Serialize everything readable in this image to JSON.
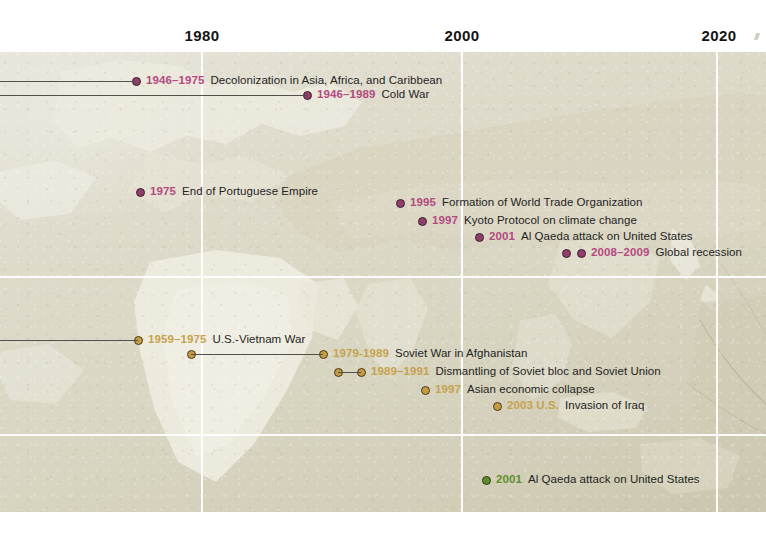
{
  "axis": {
    "ticks": [
      {
        "label": "1980",
        "x": 202
      },
      {
        "label": "2000",
        "x": 462
      },
      {
        "label": "2020",
        "x": 719
      }
    ]
  },
  "grid": {
    "vertical_x": [
      202,
      462,
      717
    ],
    "horizontal_y": [
      276,
      434
    ]
  },
  "colors": {
    "purple_dot": "#8f3f68",
    "purple_text": "#b34a80",
    "orange_dot": "#c79a46",
    "orange_text": "#c5a24e",
    "green_dot": "#5f8a2e",
    "green_text": "#5f8f2c",
    "description_text": "#24241f",
    "gridline": "#ffffff",
    "span_line": "#51504a",
    "map_land": "#eceade",
    "map_sea": "#d6d2bf"
  },
  "events": [
    {
      "id": "decolonization",
      "series": "purple",
      "year": "1946–1975",
      "description": "Decolonization in Asia, Africa, and Caribbean",
      "dot_x": 136,
      "y": 81,
      "span_from_x": 0,
      "span_to_x": 136
    },
    {
      "id": "cold-war",
      "series": "purple",
      "year": "1946–1989",
      "description": "Cold War",
      "dot_x": 307,
      "y": 95,
      "span_from_x": 0,
      "span_to_x": 307
    },
    {
      "id": "end-portuguese-empire",
      "series": "purple",
      "year": "1975",
      "description": "End of Portuguese Empire",
      "dot_x": 140,
      "y": 192,
      "span_from_x": null,
      "span_to_x": null
    },
    {
      "id": "wto-formation",
      "series": "purple",
      "year": "1995",
      "description": "Formation of World Trade Organization",
      "dot_x": 400,
      "y": 203,
      "span_from_x": null,
      "span_to_x": null
    },
    {
      "id": "kyoto-protocol",
      "series": "purple",
      "year": "1997",
      "description": "Kyoto Protocol on climate change",
      "dot_x": 422,
      "y": 221,
      "span_from_x": null,
      "span_to_x": null
    },
    {
      "id": "al-qaeda-attack-purple",
      "series": "purple",
      "year": "2001",
      "description": "Al Qaeda attack on United States",
      "dot_x": 479,
      "y": 237,
      "span_from_x": null,
      "span_to_x": null
    },
    {
      "id": "global-recession",
      "series": "purple",
      "year": "2008–2009",
      "description": "Global recession",
      "dot_x": 566,
      "dot_x2": 581,
      "y": 253,
      "span_from_x": null,
      "span_to_x": null
    },
    {
      "id": "us-vietnam-war",
      "series": "orange",
      "year": "1959–1975",
      "description": "U.S.-Vietnam War",
      "dot_x": 138,
      "y": 340,
      "span_from_x": 0,
      "span_to_x": 138
    },
    {
      "id": "soviet-war-afghanistan",
      "series": "orange",
      "year": "1979-1989",
      "description": "Soviet War in Afghanistan",
      "dot_x": 323,
      "y": 354,
      "span_from_x": 191,
      "span_to_x": 323
    },
    {
      "id": "dismantling-soviet-bloc",
      "series": "orange",
      "year": "1989–1991",
      "description": "Dismantling of Soviet bloc and Soviet Union",
      "dot_x": 361,
      "y": 372,
      "span_from_x": 338,
      "span_to_x": 361
    },
    {
      "id": "asian-economic-collapse",
      "series": "orange",
      "year": "1997",
      "description": "Asian economic collapse",
      "dot_x": 425,
      "y": 390,
      "span_from_x": null,
      "span_to_x": null
    },
    {
      "id": "us-invasion-iraq",
      "series": "orange",
      "year": "2003 U.S.",
      "description": "Invasion of Iraq",
      "dot_x": 497,
      "y": 406,
      "span_from_x": null,
      "span_to_x": null
    },
    {
      "id": "al-qaeda-attack-green",
      "series": "green",
      "year": "2001",
      "description": "Al Qaeda attack on United States",
      "dot_x": 486,
      "y": 480,
      "span_from_x": null,
      "span_to_x": null
    }
  ]
}
